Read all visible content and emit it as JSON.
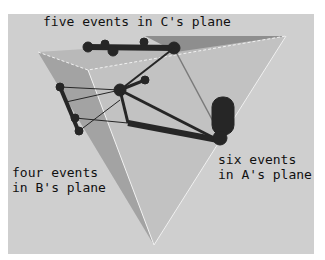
{
  "figure": {
    "labels": {
      "c_plane": "five events in C's plane",
      "b_plane_line1": "four events",
      "b_plane_line2": "in B's plane",
      "a_plane_line1": "six events",
      "a_plane_line2": "in A's plane"
    },
    "colors": {
      "background": "#cfcfcf",
      "plane_light": "#bdbdbd",
      "plane_mid": "#a8a8a8",
      "plane_dark": "#8c8c8c",
      "node": "#2a2a2a"
    }
  }
}
